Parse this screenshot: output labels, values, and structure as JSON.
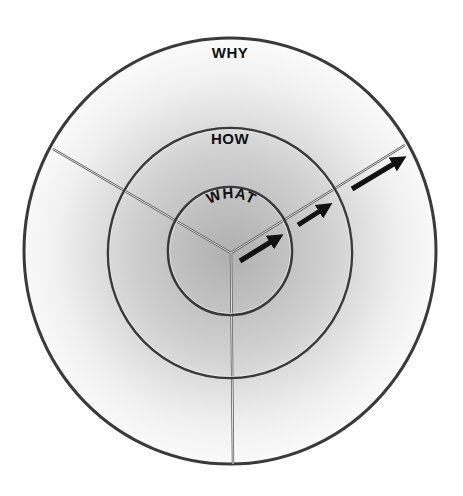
{
  "diagram": {
    "colors": {
      "ring_stroke": "#3a3a3a",
      "divider": "#ffffff",
      "arrow": "#111111",
      "gradient_center": "#b4b4b4",
      "gradient_edge": "#ffffff"
    },
    "rings": [
      {
        "id": "why",
        "label": "WHY",
        "cx": 230,
        "cy": 251,
        "rx": 206,
        "ry": 213
      },
      {
        "id": "how",
        "label": "HOW",
        "cx": 230,
        "cy": 253,
        "rx": 122,
        "ry": 125
      },
      {
        "id": "what",
        "label": "WHAT",
        "cx": 230,
        "cy": 251,
        "rx": 62,
        "ry": 64
      }
    ],
    "center": {
      "x": 231,
      "y": 253
    },
    "dividers": [
      {
        "id": "upper-left",
        "x2": 53,
        "y2": 149
      },
      {
        "id": "upper-right",
        "x2": 405,
        "y2": 145
      },
      {
        "id": "bottom",
        "x2": 233,
        "y2": 464
      }
    ],
    "arrows": [
      {
        "id": "arrow-1",
        "x1": 240,
        "y1": 261,
        "x2": 282,
        "y2": 235
      },
      {
        "id": "arrow-2",
        "x1": 298,
        "y1": 225,
        "x2": 331,
        "y2": 204
      },
      {
        "id": "arrow-3",
        "x1": 352,
        "y1": 189,
        "x2": 405,
        "y2": 157
      }
    ]
  }
}
